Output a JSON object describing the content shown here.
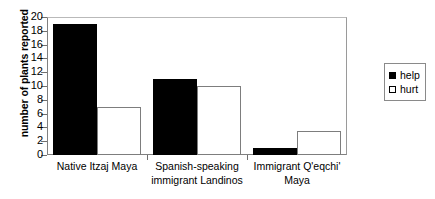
{
  "chart_data": {
    "type": "bar",
    "title": "",
    "xlabel": "",
    "ylabel": "number of plants reported",
    "ylim": [
      0,
      20
    ],
    "ytick_step": 2,
    "yticks": [
      0,
      2,
      4,
      6,
      8,
      10,
      12,
      14,
      16,
      18,
      20
    ],
    "grid": false,
    "legend_position": "right",
    "categories": [
      "Native Itzaj Maya",
      "Spanish-speaking\nimmigrant Landinos",
      "Immigrant Q'eqchi'\nMaya"
    ],
    "series": [
      {
        "name": "help",
        "color": "#000000",
        "values": [
          19,
          11,
          1
        ]
      },
      {
        "name": "hurt",
        "color": "#ffffff",
        "values": [
          7,
          10,
          3.5
        ]
      }
    ]
  },
  "legend": {
    "items": [
      {
        "label": "help",
        "style": "filled"
      },
      {
        "label": "hurt",
        "style": "open"
      }
    ]
  }
}
